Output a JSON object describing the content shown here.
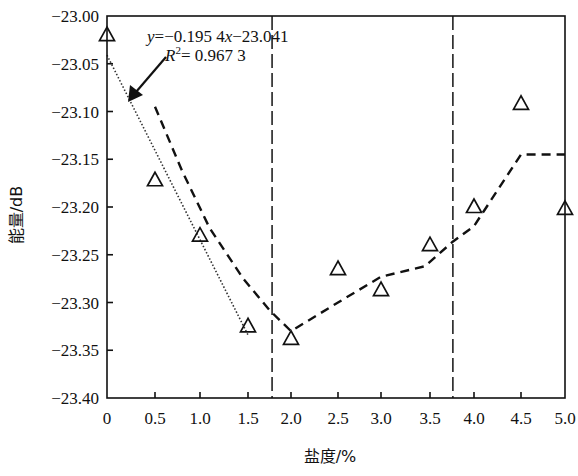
{
  "chart_data": {
    "type": "scatter",
    "title": "",
    "xlabel": "盐度/%",
    "ylabel": "能量/dB",
    "xlim": [
      0,
      5.0
    ],
    "ylim": [
      -23.4,
      -23.0
    ],
    "grid": false,
    "legend": null,
    "x_ticks": [
      "0",
      "0.5",
      "1.0",
      "1.5",
      "2.0",
      "2.5",
      "3.0",
      "3.5",
      "4.0",
      "4.5",
      "5.0"
    ],
    "y_ticks": [
      "-23.00",
      "-23.05",
      "-23.10",
      "-23.15",
      "-23.20",
      "-23.25",
      "-23.30",
      "-23.35",
      "-23.40"
    ],
    "series": [
      {
        "name": "measured",
        "marker": "triangle-open",
        "x": [
          0,
          0.5,
          1.0,
          1.5,
          2.0,
          2.5,
          3.0,
          3.5,
          4.0,
          4.5,
          5.0
        ],
        "y": [
          -23.02,
          -23.172,
          -23.23,
          -23.325,
          -23.338,
          -23.265,
          -23.287,
          -23.24,
          -23.2,
          -23.092,
          -23.202
        ]
      },
      {
        "name": "linear fit (0–1.5%)",
        "style": "dotted",
        "equation": "y=-0.1954x-23.041",
        "r_squared": "R²= 0.9673",
        "x": [
          0,
          1.5
        ],
        "y": [
          -23.041,
          -23.334
        ]
      },
      {
        "name": "trend",
        "style": "dashed",
        "x": [
          0.5,
          0.8,
          1.1,
          1.45,
          1.75,
          2.0,
          2.5,
          3.0,
          3.45,
          3.75,
          4.0,
          4.5,
          5.0
        ],
        "y": [
          -23.095,
          -23.162,
          -23.222,
          -23.275,
          -23.308,
          -23.33,
          -23.3,
          -23.273,
          -23.262,
          -23.237,
          -23.22,
          -23.145,
          -23.145
        ]
      }
    ],
    "vertical_dividers_x": [
      1.78,
      3.76
    ],
    "annotations": [
      {
        "text_line1_prefix": "y",
        "text_line1": "=−0.195 4",
        "text_line1_var": "x",
        "text_line1_suffix": "−23.041"
      },
      {
        "text_line2_prefix": "R",
        "text_line2_sup": "2",
        "text_line2": "= 0.967 3"
      }
    ]
  },
  "labels": {
    "xlabel": "盐度/%",
    "ylabel": "能量/dB",
    "eq_y": "y",
    "eq_mid": "=−0.195 4",
    "eq_x": "x",
    "eq_end": "−23.041",
    "r_R": "R",
    "r_sup": "2",
    "r_val": "= 0.967 3"
  }
}
